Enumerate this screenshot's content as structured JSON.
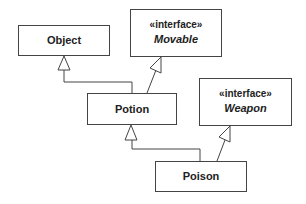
{
  "diagram": {
    "type": "uml-class-diagram",
    "classes": [
      {
        "id": "object",
        "name": "Object",
        "stereotype": null
      },
      {
        "id": "movable",
        "name": "Movable",
        "stereotype": "«interface»"
      },
      {
        "id": "potion",
        "name": "Potion",
        "stereotype": null
      },
      {
        "id": "weapon",
        "name": "Weapon",
        "stereotype": "«interface»"
      },
      {
        "id": "poison",
        "name": "Poison",
        "stereotype": null
      }
    ],
    "relationships": [
      {
        "from": "Potion",
        "to": "Object",
        "kind": "generalization"
      },
      {
        "from": "Potion",
        "to": "Movable",
        "kind": "realization"
      },
      {
        "from": "Poison",
        "to": "Potion",
        "kind": "generalization"
      },
      {
        "from": "Poison",
        "to": "Weapon",
        "kind": "realization"
      }
    ],
    "colors": {
      "line": "#444444",
      "text": "#222222",
      "background": "#ffffff"
    }
  }
}
